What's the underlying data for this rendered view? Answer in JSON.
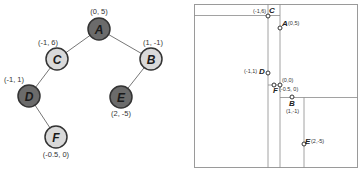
{
  "colors": {
    "dark_node": "#6b6b6b",
    "light_node": "#d9d9d9",
    "node_stroke": "#333333",
    "edge": "#777777",
    "kd_line": "#8a8a8a",
    "kd_border": "#9a9a9a"
  },
  "tree": {
    "nodes": [
      {
        "id": "A",
        "label": "A",
        "coord": "(0, 5)",
        "fill": "dark"
      },
      {
        "id": "C",
        "label": "C",
        "coord": "(-1, 6)",
        "fill": "light"
      },
      {
        "id": "B",
        "label": "B",
        "coord": "(1, -1)",
        "fill": "light"
      },
      {
        "id": "D",
        "label": "D",
        "coord": "(-1, 1)",
        "fill": "dark"
      },
      {
        "id": "E",
        "label": "E",
        "coord": "(2, -5)",
        "fill": "dark"
      },
      {
        "id": "F",
        "label": "F",
        "coord": "(-0.5, 0)",
        "fill": "light"
      }
    ],
    "edges": [
      [
        "A",
        "C"
      ],
      [
        "A",
        "B"
      ],
      [
        "C",
        "D"
      ],
      [
        "B",
        "E"
      ],
      [
        "D",
        "F"
      ]
    ]
  },
  "kd_plot": {
    "points": [
      {
        "id": "C",
        "label": "C",
        "coord": "(-1,6)"
      },
      {
        "id": "A",
        "label": "A",
        "coord": "(0,5)"
      },
      {
        "id": "D",
        "label": "D",
        "coord": "(-1,1)"
      },
      {
        "id": "origin",
        "label": "",
        "coord": "(0,0)"
      },
      {
        "id": "F",
        "label": "F",
        "coord": "(-0.5, 0)"
      },
      {
        "id": "B",
        "label": "B",
        "coord": "(1,-1)"
      },
      {
        "id": "E",
        "label": "E",
        "coord": "(2,-5)"
      }
    ]
  }
}
